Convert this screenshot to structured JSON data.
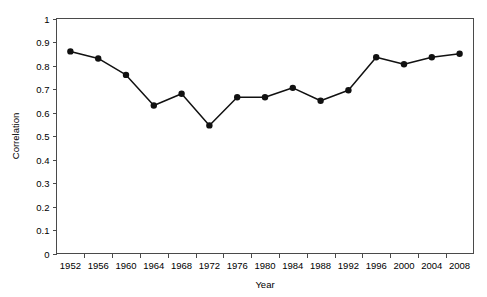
{
  "chart_data": {
    "type": "line",
    "title": "",
    "xlabel": "Year",
    "ylabel": "Correlation",
    "x": [
      1952,
      1956,
      1960,
      1964,
      1968,
      1972,
      1976,
      1980,
      1984,
      1988,
      1992,
      1996,
      2000,
      2004,
      2008
    ],
    "values": [
      0.86,
      0.83,
      0.76,
      0.63,
      0.68,
      0.545,
      0.665,
      0.665,
      0.705,
      0.65,
      0.695,
      0.835,
      0.805,
      0.835,
      0.85
    ],
    "categories": [
      "1952",
      "1956",
      "1960",
      "1964",
      "1968",
      "1972",
      "1976",
      "1980",
      "1984",
      "1988",
      "1992",
      "1996",
      "2000",
      "2004",
      "2008"
    ],
    "xtick_labels": [
      "1952",
      "1956",
      "1960",
      "1964",
      "1968",
      "1972",
      "1976",
      "1980",
      "1984",
      "1988",
      "1992",
      "1996",
      "2000",
      "2004",
      "2008"
    ],
    "ytick_labels": [
      "0",
      "0.1",
      "0.2",
      "0.3",
      "0.4",
      "0.5",
      "0.6",
      "0.7",
      "0.8",
      "0.9",
      "1"
    ],
    "ytick_values": [
      0,
      0.1,
      0.2,
      0.3,
      0.4,
      0.5,
      0.6,
      0.7,
      0.8,
      0.9,
      1
    ],
    "ylim": [
      0,
      1
    ],
    "grid": false,
    "legend": null,
    "marker": "filled-circle",
    "line_color": "#111111",
    "marker_color": "#111111",
    "axis_color": "#4a4a4a",
    "background": "#ffffff"
  },
  "axes": {
    "y_title": "Correlation",
    "x_title": "Year"
  }
}
